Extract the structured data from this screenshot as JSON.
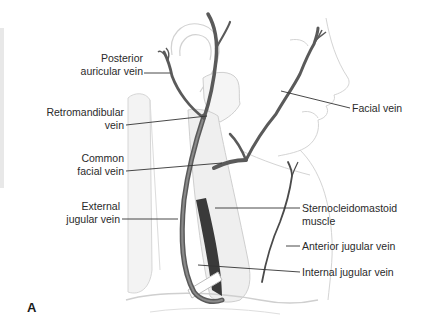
{
  "figure": {
    "panel_letter": "A",
    "colors": {
      "vein_dark": "#4a4a4a",
      "vein_mid": "#7a7a7a",
      "outline": "#c8c8c8",
      "muscle_fill": "#ededed",
      "leader": "#333333",
      "text": "#2a2a2a"
    },
    "labels_left": [
      {
        "id": "posterior-auricular-vein",
        "lines": [
          "Posterior",
          "auricular vein"
        ]
      },
      {
        "id": "retromandibular-vein",
        "lines": [
          "Retromandibular",
          "vein"
        ]
      },
      {
        "id": "common-facial-vein",
        "lines": [
          "Common",
          "facial vein"
        ]
      },
      {
        "id": "external-jugular-vein",
        "lines": [
          "External",
          "jugular vein"
        ]
      }
    ],
    "labels_right": [
      {
        "id": "facial-vein",
        "lines": [
          "Facial vein"
        ]
      },
      {
        "id": "sternocleidomastoid-muscle",
        "lines": [
          "Sternocleidomastoid",
          "muscle"
        ]
      },
      {
        "id": "anterior-jugular-vein",
        "lines": [
          "Anterior jugular vein"
        ]
      },
      {
        "id": "internal-jugular-vein",
        "lines": [
          "Internal jugular vein"
        ]
      }
    ]
  }
}
